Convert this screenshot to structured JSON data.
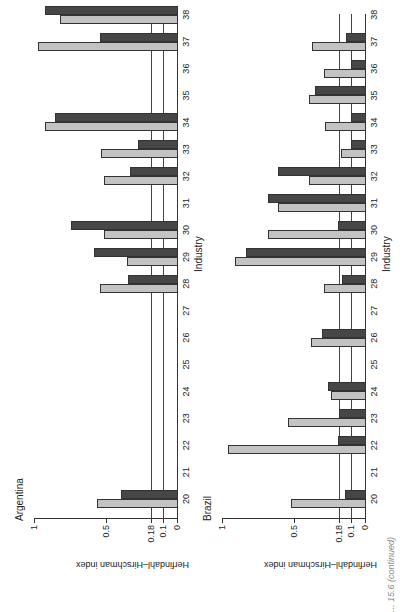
{
  "caption": "... 15.6 (continued)",
  "chart_data": [
    {
      "type": "bar",
      "title": "Argentina",
      "xlabel": "Industry",
      "ylabel": "Herfindahl–Hirschman index",
      "yticks": [
        "0",
        "0.1",
        "0.18",
        "0.5",
        "1"
      ],
      "ylim": [
        0,
        1
      ],
      "reference_lines": [
        0.1,
        0.18
      ],
      "categories": [
        "20",
        "21",
        "22",
        "23",
        "24",
        "25",
        "26",
        "27",
        "28",
        "29",
        "30",
        "31",
        "32",
        "33",
        "34",
        "35",
        "36",
        "37",
        "38"
      ],
      "series": [
        {
          "name": "light",
          "values": [
            0.56,
            null,
            null,
            null,
            null,
            null,
            null,
            null,
            0.54,
            0.35,
            0.51,
            null,
            0.51,
            0.53,
            0.92,
            null,
            null,
            0.97,
            0.82
          ]
        },
        {
          "name": "dark",
          "values": [
            0.39,
            null,
            null,
            null,
            null,
            null,
            null,
            null,
            0.34,
            0.58,
            0.74,
            null,
            0.33,
            0.27,
            0.85,
            null,
            null,
            0.54,
            0.92
          ]
        }
      ]
    },
    {
      "type": "bar",
      "title": "Brazil",
      "xlabel": "Industry",
      "ylabel": "Herfindahl–Hirschman index",
      "yticks": [
        "0",
        "0.1",
        "0.18",
        "0.5",
        "1"
      ],
      "ylim": [
        0,
        1
      ],
      "reference_lines": [
        0.1,
        0.18
      ],
      "categories": [
        "20",
        "21",
        "22",
        "23",
        "24",
        "25",
        "26",
        "27",
        "28",
        "29",
        "30",
        "31",
        "32",
        "33",
        "34",
        "35",
        "36",
        "37",
        "38"
      ],
      "series": [
        {
          "name": "light",
          "values": [
            0.52,
            null,
            0.96,
            0.54,
            0.24,
            null,
            0.38,
            null,
            0.29,
            0.91,
            0.68,
            0.61,
            0.39,
            0.17,
            0.28,
            0.39,
            0.29,
            0.37,
            null
          ]
        },
        {
          "name": "dark",
          "values": [
            0.14,
            null,
            0.19,
            0.18,
            0.26,
            null,
            0.3,
            null,
            0.16,
            0.83,
            0.19,
            0.68,
            0.61,
            0.1,
            0.1,
            0.35,
            0.1,
            0.13,
            null
          ]
        }
      ]
    }
  ]
}
